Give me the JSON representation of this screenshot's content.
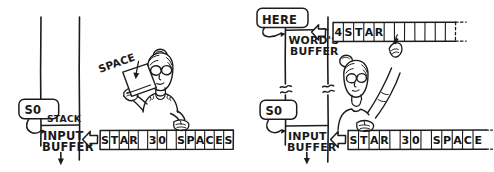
{
  "figure": {
    "panels": [
      {
        "id": "left-panel",
        "name": "before-parsing",
        "stack_pointer_label": "S0",
        "stack_label": "STACK",
        "input_buffer_label": "INPUT\nBUFFER",
        "input_buffer_line1": "INPUT",
        "input_buffer_line2": "BUFFER",
        "held_card_label": "SPACE",
        "character_fan_label": "SPACE",
        "tape": {
          "name": "input-buffer-tape",
          "cells": [
            "S",
            "T",
            "A",
            "R",
            "",
            "3",
            "0",
            "",
            "S",
            "P",
            "A",
            "C",
            "E",
            "S"
          ],
          "cell_count": 14,
          "text_reading": "STAR 30 SPACES"
        },
        "pointer_arrow": "left-chevron",
        "down_arrow": "down-arrow"
      },
      {
        "id": "right-panel",
        "name": "after-parsing",
        "here_label": "HERE",
        "words_buffer_line1": "WORD'S",
        "words_buffer_line2": "BUFFER",
        "stack_pointer_label": "S0",
        "input_buffer_line1": "INPUT",
        "input_buffer_line2": "BUFFER",
        "word_tape": {
          "name": "words-buffer-tape",
          "cells": [
            "4",
            "S",
            "T",
            "A",
            "R",
            "",
            "",
            "",
            "",
            "",
            "",
            ""
          ],
          "cell_count": 12,
          "count_prefix": "4",
          "word_text": "STAR",
          "text_reading": "4 STAR"
        },
        "input_tape": {
          "name": "input-buffer-tape",
          "cells": [
            "S",
            "T",
            "A",
            "R",
            "",
            "3",
            "0",
            "",
            "S",
            "P",
            "A",
            "C",
            "E"
          ],
          "cell_count": 13,
          "text_reading": "STAR 30 SPACE"
        },
        "pointer_arrow": "left-chevron",
        "down_arrow": "down-arrow",
        "break_marks": "tilde-break"
      }
    ],
    "colors": {
      "ink": "#1c1c1c",
      "paper": "#ffffff"
    },
    "icons": {
      "left_chevron": "left-chevron-icon",
      "down_arrow": "down-arrow-icon",
      "curved_arrow": "curved-arrow-icon",
      "break_mark": "break-mark-icon",
      "pointing_hand": "pointing-hand-icon",
      "person": "person-icon",
      "card": "card-icon"
    }
  }
}
